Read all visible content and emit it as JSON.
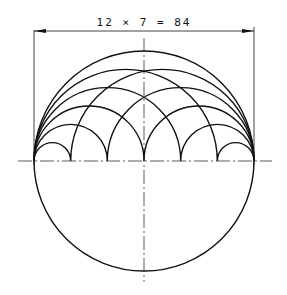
{
  "drawing": {
    "dimension_label": "12 × 7 = 84",
    "divisions": 6,
    "line_color": "#111111"
  }
}
